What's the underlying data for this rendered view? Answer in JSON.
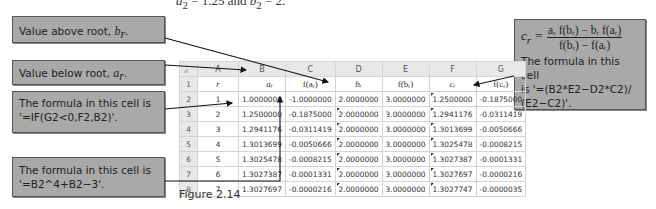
{
  "top_text": {
    "a_label": "a",
    "a_sub": "2",
    "middle": " = 1.25 and ",
    "b_label": "b",
    "b_sub": "2",
    "end": " = 2."
  },
  "callouts": {
    "above": {
      "text": "Value above root, ",
      "var": "b",
      "sub": "r"
    },
    "below": {
      "text": "Value below root, ",
      "var": "a",
      "sub": "r"
    },
    "if_formula": {
      "line1": "The formula in this cell is",
      "line2": "'=IF(G2<0,F2,B2)'."
    },
    "pow_formula": {
      "line1": "The formula in this cell is",
      "line2": "'=B2^4+B2−3'."
    },
    "cr_formula": {
      "lhs": "c",
      "lhs_sub": "r",
      "equals": "=",
      "numerator": "aᵣ f(bᵣ) − bᵣ f(aᵣ)",
      "denominator": "f(bᵣ) − f(aᵣ)",
      "line1": "The formula in this cell",
      "line2": "is '=(B2*E2−D2*C2)/",
      "line3": "(E2−C2)'."
    }
  },
  "sheet": {
    "corner": "◢",
    "columns": [
      "A",
      "B",
      "C",
      "D",
      "E",
      "F",
      "G"
    ],
    "header_row": {
      "row": "1",
      "cells": [
        "r",
        "aᵣ",
        "f(aᵣ)",
        "bᵣ",
        "f(bᵣ)",
        "cᵣ",
        "f(cᵣ)"
      ]
    },
    "rows": [
      {
        "row": "2",
        "cells": [
          "1",
          "1.0000000",
          "-1.0000000",
          "2.0000000",
          "3.0000000",
          "1.2500000",
          "-0.1875000"
        ]
      },
      {
        "row": "3",
        "cells": [
          "2",
          "1.2500000",
          "-0.1875000",
          "2.0000000",
          "3.0000000",
          "1.2941176",
          "-0.0311419"
        ]
      },
      {
        "row": "4",
        "cells": [
          "3",
          "1.2941176",
          "-0.0311419",
          "2.0000000",
          "3.0000000",
          "1.3013699",
          "-0.0050666"
        ]
      },
      {
        "row": "5",
        "cells": [
          "4",
          "1.3013699",
          "-0.0050666",
          "2.0000000",
          "3.0000000",
          "1.3025478",
          "-0.0008215"
        ]
      },
      {
        "row": "6",
        "cells": [
          "5",
          "1.3025478",
          "-0.0008215",
          "2.0000000",
          "3.0000000",
          "1.3027387",
          "-0.0001331"
        ]
      },
      {
        "row": "7",
        "cells": [
          "6",
          "1.3027387",
          "-0.0001331",
          "2.0000000",
          "3.0000000",
          "1.3027697",
          "-0.0000216"
        ]
      },
      {
        "row": "8",
        "cells": [
          "7",
          "1.3027697",
          "-0.0000216",
          "2.0000000",
          "3.0000000",
          "1.3027747",
          "-0.0000035"
        ]
      }
    ]
  },
  "caption": "Figure 2.14",
  "colors": {
    "callout_bg": "#a9a9a9",
    "header_bg": "#e8e8e8",
    "grid": "#d4d4d4"
  }
}
